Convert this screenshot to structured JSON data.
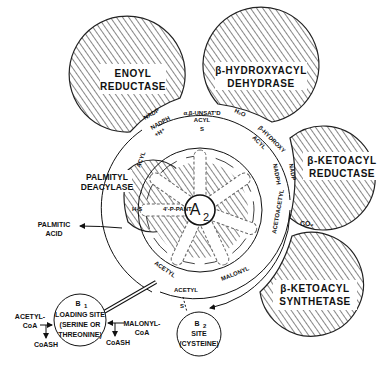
{
  "diagram": {
    "title": "",
    "enzymes": {
      "enoyl_reductase": [
        "ENOYL",
        "REDUCTASE"
      ],
      "hydroxyacyl_dehydrase": [
        "β-HYDROXYACYL",
        "DEHYDRASE"
      ],
      "ketoacyl_reductase": [
        "β-KETOACYL",
        "REDUCTASE"
      ],
      "palmityl_deacylase": [
        "PALMITYL",
        "DEACYLASE"
      ],
      "ketoacyl_synthetase": [
        "β-KETOACYL",
        "SYNTHETASE"
      ]
    },
    "core": {
      "label": "A",
      "subscript": "2"
    },
    "arm_labels": {
      "unsat": [
        "α,β-UNSAT'D",
        "ACYL"
      ],
      "hydroxy": [
        "β-HYDROXY",
        "ACYL"
      ],
      "acyl": "ACYL",
      "acetoacetyl": "ACETOACETYL",
      "malonyl": "MALONYL",
      "acetyl_arm": "ACETYL",
      "acetyl_b2": "ACETYL",
      "ppant": "4'-P-PANT",
      "hs": "H-S",
      "s": "S"
    },
    "cofactors": {
      "nadp_left": "NADP",
      "nadph_left": [
        "NADPH",
        "+H⁺"
      ],
      "h2o": "H₂O",
      "nadph_right": [
        "NADPH",
        "+H⁺"
      ],
      "nadp_right": "NADP",
      "co2": "CO₂"
    },
    "products": {
      "palmitic_acid": [
        "PALMITIC",
        "ACID"
      ]
    },
    "b1_site": {
      "title": "B",
      "subscript": "1",
      "lines": [
        "LOADING SITE",
        "(SERINE OR",
        "THREONINE)"
      ]
    },
    "b2_site": {
      "title": "B",
      "subscript": "2",
      "lines": [
        "SITE",
        "(CYSTEINE)"
      ]
    },
    "inputs": {
      "acetyl_coa": [
        "ACETYL-",
        "CoA"
      ],
      "malonyl_coa": [
        "MALONYL-",
        "CoA"
      ],
      "coash_left": "CoASH",
      "coash_right": "CoASH"
    }
  }
}
